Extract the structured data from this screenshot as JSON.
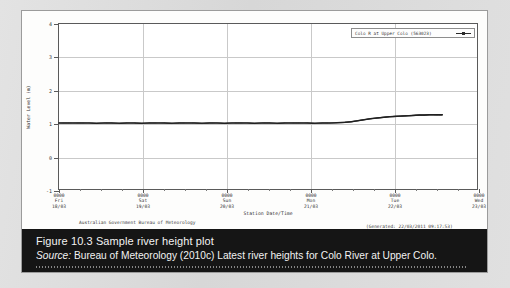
{
  "figure": {
    "caption_title": "Figure 10.3  Sample river height plot",
    "source_label": "Source:",
    "source_text": " Bureau of Meteorology (2010c) Latest river heights for Colo River at Upper Colo."
  },
  "plot": {
    "agency_footer": "Australian Government Bureau of Meteorology",
    "generated_footer": "(Generated: 22/03/2011 09:17:53)",
    "legend_label": "Colo R at Upper Colo (563023)"
  },
  "chart_data": {
    "type": "line",
    "title": "",
    "xlabel": "Station Date/Time",
    "ylabel": "Water Level (m)",
    "legend": [
      "Colo R at Upper Colo (563023)"
    ],
    "legend_position": "top-right",
    "grid": true,
    "ylim": [
      -1,
      4
    ],
    "yticks": [
      -1,
      0,
      1,
      2,
      3,
      4
    ],
    "ytick_labels": [
      "-1",
      "0",
      "1",
      "2",
      "3",
      "4"
    ],
    "xlim_labels": [
      "0000 Fri 18/03",
      "0000 Wed 23/03"
    ],
    "xticks": [
      {
        "time": "0000",
        "day": "Fri",
        "date": "18/03",
        "pos": 0
      },
      {
        "time": "0000",
        "day": "Sat",
        "date": "19/03",
        "pos": 0.2
      },
      {
        "time": "0000",
        "day": "Sun",
        "date": "20/03",
        "pos": 0.4
      },
      {
        "time": "0000",
        "day": "Mon",
        "date": "21/03",
        "pos": 0.6
      },
      {
        "time": "0000",
        "day": "Tue",
        "date": "22/03",
        "pos": 0.8
      },
      {
        "time": "0000",
        "day": "Wed",
        "date": "23/03",
        "pos": 1.0
      }
    ],
    "series": [
      {
        "name": "Colo R at Upper Colo (563023)",
        "x": [
          0.0,
          0.018,
          0.036,
          0.054,
          0.072,
          0.09,
          0.108,
          0.126,
          0.144,
          0.162,
          0.18,
          0.198,
          0.216,
          0.234,
          0.252,
          0.27,
          0.288,
          0.306,
          0.324,
          0.342,
          0.36,
          0.378,
          0.396,
          0.414,
          0.432,
          0.45,
          0.468,
          0.486,
          0.504,
          0.522,
          0.54,
          0.558,
          0.576,
          0.594,
          0.612,
          0.63,
          0.648,
          0.666,
          0.684,
          0.7,
          0.715,
          0.73,
          0.745,
          0.76,
          0.775,
          0.79,
          0.805,
          0.82,
          0.835,
          0.85,
          0.862,
          0.874,
          0.886,
          0.898,
          0.908,
          0.918
        ],
        "y": [
          1.0,
          1.0,
          1.0,
          1.0,
          1.0,
          0.99,
          1.0,
          1.0,
          0.99,
          1.0,
          1.0,
          0.99,
          1.0,
          1.0,
          1.0,
          0.99,
          1.0,
          1.0,
          1.0,
          0.99,
          1.0,
          1.0,
          0.99,
          1.0,
          1.0,
          1.0,
          0.99,
          1.0,
          1.0,
          0.99,
          1.0,
          1.0,
          1.0,
          1.0,
          0.99,
          1.0,
          1.0,
          1.01,
          1.02,
          1.04,
          1.07,
          1.1,
          1.13,
          1.15,
          1.17,
          1.19,
          1.2,
          1.21,
          1.22,
          1.23,
          1.24,
          1.24,
          1.25,
          1.25,
          1.25,
          1.25
        ]
      }
    ]
  }
}
